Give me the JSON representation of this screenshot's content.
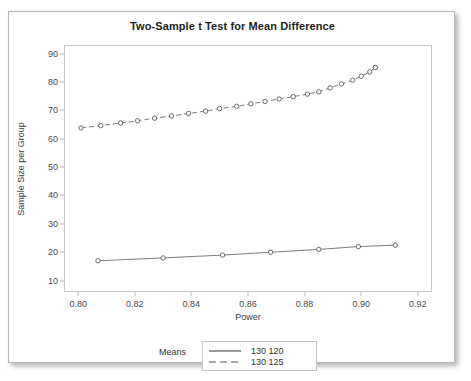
{
  "top_sliver_text": "",
  "card": {
    "title": "Two-Sample t Test for Mean Difference"
  },
  "legend": {
    "title": "Means",
    "entries": [
      {
        "label": "130 120",
        "style": "solid"
      },
      {
        "label": "130 125",
        "style": "dashed"
      }
    ]
  },
  "colors": {
    "frame": "#c9c9c9",
    "text": "#3c3c3c",
    "series_solid": "#6d6d6d",
    "series_dashed": "#6d6d6d",
    "marker_edge": "#5a5a5a",
    "marker_fill": "#ffffff",
    "card_border": "#b6b6b6"
  },
  "chart_data": {
    "type": "line",
    "title": "Two-Sample t Test for Mean Difference",
    "xlabel": "Power",
    "ylabel": "Sample Size per Group",
    "xlim": [
      0.795,
      0.925
    ],
    "ylim": [
      6,
      93
    ],
    "xticks": [
      0.8,
      0.82,
      0.84,
      0.86,
      0.88,
      0.9,
      0.92
    ],
    "xtick_labels": [
      "0.80",
      "0.82",
      "0.84",
      "0.86",
      "0.88",
      "0.90",
      "0.92"
    ],
    "yticks": [
      10,
      20,
      30,
      40,
      50,
      60,
      70,
      80,
      90
    ],
    "ytick_labels": [
      "10",
      "20",
      "30",
      "40",
      "50",
      "60",
      "70",
      "80",
      "90"
    ],
    "grid": false,
    "legend_position": "bottom",
    "legend_title": "Means",
    "series": [
      {
        "name": "130 120",
        "style": "solid",
        "marker": "open-circle",
        "x": [
          0.807,
          0.83,
          0.851,
          0.868,
          0.885,
          0.899,
          0.912
        ],
        "y": [
          17.0,
          18.0,
          19.0,
          20.0,
          21.0,
          22.0,
          22.5
        ]
      },
      {
        "name": "130 125",
        "style": "dashed",
        "marker": "open-circle",
        "x": [
          0.801,
          0.808,
          0.815,
          0.821,
          0.827,
          0.833,
          0.839,
          0.845,
          0.85,
          0.856,
          0.861,
          0.866,
          0.871,
          0.876,
          0.881,
          0.885,
          0.889,
          0.893,
          0.897,
          0.9,
          0.903,
          0.905
        ],
        "y": [
          63.8,
          64.6,
          65.5,
          66.3,
          67.2,
          68.0,
          68.9,
          69.7,
          70.6,
          71.4,
          72.3,
          73.1,
          74.0,
          74.8,
          75.7,
          76.5,
          77.9,
          79.3,
          80.6,
          82.0,
          83.5,
          85.1
        ]
      }
    ]
  }
}
